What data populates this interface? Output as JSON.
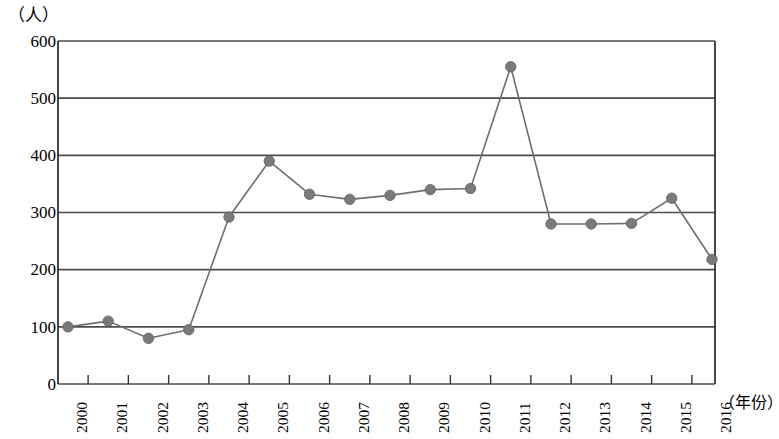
{
  "chart_data": {
    "type": "line",
    "title": "",
    "subtitle": "",
    "xlabel": "（年份）",
    "ylabel": "（人）",
    "x": [
      2000,
      2001,
      2002,
      2003,
      2004,
      2005,
      2006,
      2007,
      2008,
      2009,
      2010,
      2011,
      2012,
      2013,
      2014,
      2015,
      2016
    ],
    "categories": [
      "2000",
      "2001",
      "2002",
      "2003",
      "2004",
      "2005",
      "2006",
      "2007",
      "2008",
      "2009",
      "2010",
      "2011",
      "2012",
      "2013",
      "2014",
      "2015",
      "2016"
    ],
    "values": [
      100,
      110,
      80,
      95,
      292,
      390,
      332,
      323,
      330,
      340,
      342,
      555,
      280,
      280,
      281,
      325,
      218
    ],
    "series": [
      {
        "name": "",
        "values": [
          100,
          110,
          80,
          95,
          292,
          390,
          332,
          323,
          330,
          340,
          342,
          555,
          280,
          280,
          281,
          325,
          218
        ]
      }
    ],
    "ylim": [
      0,
      600
    ],
    "yticks": [
      0,
      100,
      200,
      300,
      400,
      500,
      600
    ],
    "ytick_labels": [
      "0",
      "100",
      "200",
      "300",
      "400",
      "500",
      "600"
    ],
    "grid": true,
    "grid_axis": "y",
    "legend": false,
    "legend_position": "none",
    "marker": "circle",
    "line_color": "#6e6e6e",
    "marker_color": "#7a7a7a",
    "grid_color": "#4d4d4d",
    "axis_color": "#333333",
    "background": "#ffffff"
  }
}
